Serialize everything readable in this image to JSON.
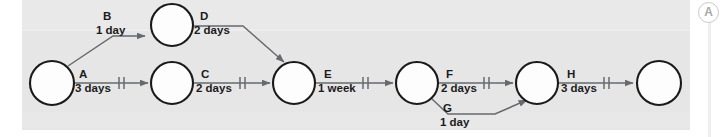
{
  "figure": {
    "kind": "activity-on-arrow-network-diagram",
    "background_color": "#e6e6e6",
    "node_fill": "#fdfdfd",
    "node_stroke": "#1a1a1a",
    "arrow_color": "#666a6e",
    "text_color": "#1b1b1b"
  },
  "annotation_marker": {
    "label": "A",
    "color": "#a8a8a8"
  },
  "nodes": [
    {
      "id": "n1",
      "cx": 52,
      "cy": 83,
      "r": 22
    },
    {
      "id": "n2",
      "cx": 172,
      "cy": 25,
      "r": 21
    },
    {
      "id": "n3",
      "cx": 172,
      "cy": 83,
      "r": 21
    },
    {
      "id": "n4",
      "cx": 294,
      "cy": 83,
      "r": 21
    },
    {
      "id": "n5",
      "cx": 417,
      "cy": 83,
      "r": 21
    },
    {
      "id": "n6",
      "cx": 537,
      "cy": 83,
      "r": 21
    },
    {
      "id": "n7",
      "cx": 659,
      "cy": 83,
      "r": 22
    }
  ],
  "activities": [
    {
      "id": "B",
      "name": "B",
      "duration": "1 day",
      "from": "n1",
      "to": "n2",
      "ticks": 0,
      "label_x": 103,
      "label_name_y": 20,
      "label_dur_y": 33
    },
    {
      "id": "D",
      "name": "D",
      "duration": "2 days",
      "from": "n2",
      "to": "n4",
      "ticks": 0,
      "label_x": 198,
      "label_name_y": 20,
      "label_dur_y": 33
    },
    {
      "id": "A",
      "name": "A",
      "duration": "3 days",
      "from": "n1",
      "to": "n3",
      "ticks": 2,
      "label_x": 79,
      "label_name_y": 78,
      "label_dur_y": 91
    },
    {
      "id": "C",
      "name": "C",
      "duration": "2 days",
      "from": "n3",
      "to": "n4",
      "ticks": 2,
      "label_x": 199,
      "label_name_y": 78,
      "label_dur_y": 91
    },
    {
      "id": "E",
      "name": "E",
      "duration": "1 week",
      "from": "n4",
      "to": "n5",
      "ticks": 2,
      "label_x": 322,
      "label_name_y": 78,
      "label_dur_y": 91
    },
    {
      "id": "F",
      "name": "F",
      "duration": "2 days",
      "from": "n5",
      "to": "n6",
      "ticks": 2,
      "label_x": 444,
      "label_name_y": 78,
      "label_dur_y": 91
    },
    {
      "id": "G",
      "name": "G",
      "duration": "1 day",
      "from": "n5",
      "to": "n6",
      "ticks": 0,
      "label_x": 441,
      "label_name_y": 112,
      "label_dur_y": 125
    },
    {
      "id": "H",
      "name": "H",
      "duration": "3 days",
      "from": "n6",
      "to": "n7",
      "ticks": 2,
      "label_x": 565,
      "label_name_y": 78,
      "label_dur_y": 91
    }
  ]
}
